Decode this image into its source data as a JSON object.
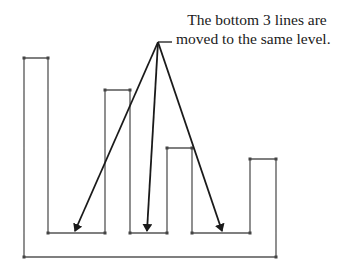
{
  "annotation": {
    "line1": "The bottom 3 lines are",
    "line2": "moved to the same level."
  },
  "colors": {
    "outline": "#555555",
    "arrow": "#1a1a1a",
    "node": "#444444"
  },
  "diagram": {
    "apex": {
      "x": 158,
      "y": 42
    },
    "arrow_targets": [
      {
        "x": 75,
        "y": 232
      },
      {
        "x": 147,
        "y": 232
      },
      {
        "x": 222,
        "y": 232
      }
    ],
    "bottom_level_y": 233,
    "baseline_y": 257
  }
}
